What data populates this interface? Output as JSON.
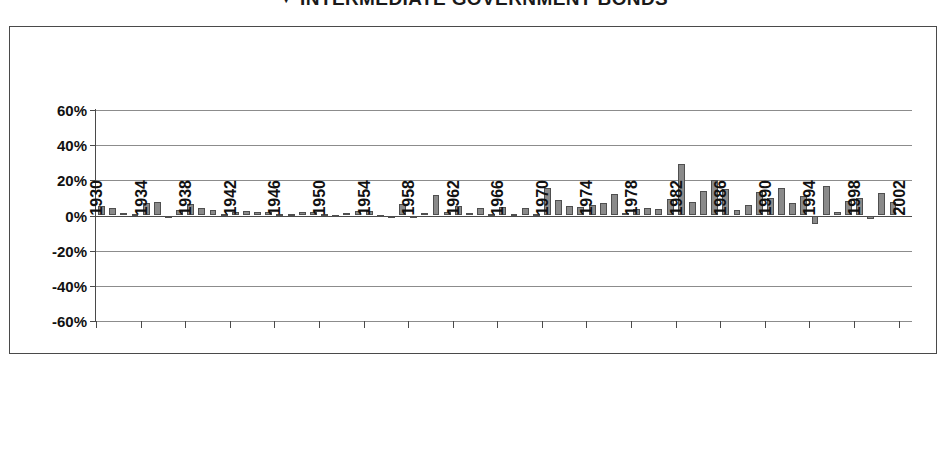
{
  "title": {
    "marker": "▼",
    "text": "INTERMEDIATE GOVERNMENT BONDS",
    "full": "▼ INTERMEDIATE GOVERNMENT BONDS"
  },
  "chart_data": {
    "type": "bar",
    "xlabel": "",
    "ylabel": "",
    "ylim": [
      -60,
      60
    ],
    "ytick_labels": [
      "60%",
      "40%",
      "20%",
      "0%",
      "-20%",
      "-40%",
      "-60%"
    ],
    "ytick_values": [
      60,
      40,
      20,
      0,
      -20,
      -40,
      -60
    ],
    "grid": true,
    "legend": "none",
    "xtick_labels": [
      "1930",
      "1934",
      "1938",
      "1942",
      "1946",
      "1950",
      "1954",
      "1958",
      "1962",
      "1966",
      "1970",
      "1974",
      "1978",
      "1982",
      "1986",
      "1990",
      "1994",
      "1998",
      "2002"
    ],
    "xtick_step": 4,
    "bar_color": "#8a8a8a",
    "bar_border_color": "#4f4f4f",
    "categories": [
      1930,
      1931,
      1932,
      1933,
      1934,
      1935,
      1936,
      1937,
      1938,
      1939,
      1940,
      1941,
      1942,
      1943,
      1944,
      1945,
      1946,
      1947,
      1948,
      1949,
      1950,
      1951,
      1952,
      1953,
      1954,
      1955,
      1956,
      1957,
      1958,
      1959,
      1960,
      1961,
      1962,
      1963,
      1964,
      1965,
      1966,
      1967,
      1968,
      1969,
      1970,
      1971,
      1972,
      1973,
      1974,
      1975,
      1976,
      1977,
      1978,
      1979,
      1980,
      1981,
      1982,
      1983,
      1984,
      1985,
      1986,
      1987,
      1988,
      1989,
      1990,
      1991,
      1992,
      1993,
      1994,
      1995,
      1996,
      1997,
      1998,
      1999,
      2000,
      2001
    ],
    "values": [
      5.4,
      4.5,
      1.5,
      0.8,
      7.2,
      7.7,
      -0.9,
      3.0,
      6.5,
      4.5,
      3.2,
      1.0,
      2.0,
      2.5,
      1.8,
      2.2,
      1.0,
      0.9,
      1.9,
      2.0,
      0.7,
      0.3,
      1.6,
      2.3,
      2.4,
      0.4,
      -0.4,
      6.5,
      -0.8,
      1.4,
      11.8,
      2.0,
      5.5,
      1.7,
      4.2,
      1.1,
      4.7,
      1.0,
      4.5,
      0.6,
      15.9,
      8.7,
      5.2,
      4.6,
      5.7,
      7.3,
      12.5,
      1.4,
      3.5,
      4.1,
      3.9,
      9.4,
      29.1,
      7.4,
      14.0,
      20.3,
      15.1,
      2.9,
      6.1,
      13.3,
      9.7,
      15.5,
      7.2,
      11.2,
      -5.1,
      16.8,
      2.1,
      8.4,
      10.2,
      -1.8,
      12.6,
      7.6
    ],
    "value_format": "percent"
  }
}
